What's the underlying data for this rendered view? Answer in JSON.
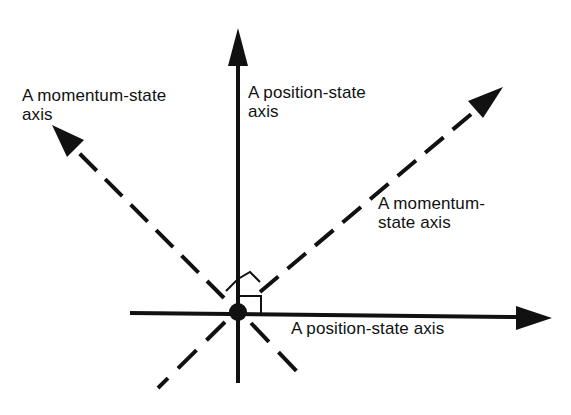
{
  "diagram": {
    "type": "vector axes diagram",
    "colors": {
      "background": "#ffffff",
      "ink": "#111111"
    },
    "labels": {
      "momentum_upper_left": {
        "line1": "A momentum-state",
        "line2": "axis"
      },
      "position_vertical": {
        "line1": "A position-state",
        "line2": "axis"
      },
      "momentum_upper_right": {
        "line1": "A momentum-",
        "line2": "state axis"
      },
      "position_horizontal": {
        "line1": "A position-state axis"
      }
    },
    "axes": [
      {
        "name": "position-state axis (vertical)",
        "style": "solid",
        "direction": "up"
      },
      {
        "name": "position-state axis (horizontal)",
        "style": "solid",
        "direction": "right"
      },
      {
        "name": "momentum-state axis (upper-left)",
        "style": "dashed",
        "direction": "up-left"
      },
      {
        "name": "momentum-state axis (upper-right)",
        "style": "dashed",
        "direction": "up-right"
      }
    ],
    "markers": [
      "origin-dot",
      "right-angle-square",
      "right-angle-diamond"
    ]
  }
}
